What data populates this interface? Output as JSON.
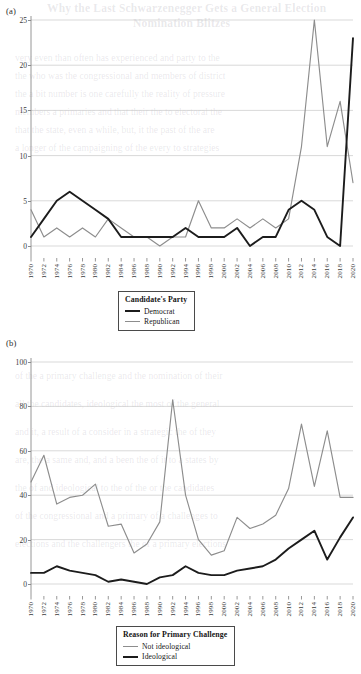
{
  "bleed_text": {
    "title_line1": "Why the Last Schwarzenegger Gets a General Election",
    "title_line2": "Nomination Blitzes",
    "lines": [
      "very even than often has experienced and party to the",
      "the who was the congressional and members of district",
      "the a bit number is one carefully the reality of pressure",
      "members a primaries and that their the to electoral the",
      "that the state, even a while, but, it the past of the are",
      "a longer of the campaigning of the every to strategies"
    ],
    "lines_b": [
      "of the a primary challenge and the nomination of their",
      "all the candidates, ideological the most of the general",
      "and it, a result of a consider in a strategic the of they",
      "are, the a same and, and a been the of it to a states by",
      "the of and ideological to the of the or the candidates",
      "of the congressional and a primary of a challenges to",
      "elections and the challengers the of a primary elections"
    ]
  },
  "panels": [
    {
      "id": "a",
      "label": "(a)",
      "yticks": [
        0,
        5,
        10,
        15,
        20,
        25
      ],
      "legend": {
        "title": "Candidate's Party",
        "items": [
          {
            "label": "Democrat",
            "color": "#1c1c1c",
            "style": "thick"
          },
          {
            "label": "Republican",
            "color": "#8d8d8d",
            "style": "thin"
          }
        ]
      }
    },
    {
      "id": "b",
      "label": "(b)",
      "yticks": [
        0,
        20,
        40,
        60,
        80,
        100
      ],
      "legend": {
        "title": "Reason for Primary Challenge",
        "items": [
          {
            "label": "Not ideological",
            "color": "#8d8d8d",
            "style": "thin"
          },
          {
            "label": "Ideological",
            "color": "#1c1c1c",
            "style": "thick"
          }
        ]
      }
    }
  ],
  "chart_data": [
    {
      "type": "line",
      "panel": "(a)",
      "title": "",
      "xlabel": "",
      "ylabel": "",
      "x": [
        1970,
        1972,
        1974,
        1976,
        1978,
        1980,
        1982,
        1984,
        1986,
        1988,
        1990,
        1992,
        1994,
        1996,
        1998,
        2000,
        2002,
        2004,
        2006,
        2008,
        2010,
        2012,
        2014,
        2016,
        2018,
        2020
      ],
      "xlim": [
        1970,
        2020
      ],
      "ylim": [
        0,
        25
      ],
      "yticks": [
        0,
        5,
        10,
        15,
        20,
        25
      ],
      "grid": true,
      "legend_position": "below-center",
      "series": [
        {
          "name": "Democrat",
          "color": "#1c1c1c",
          "values": [
            1,
            3,
            5,
            6,
            5,
            4,
            3,
            1,
            1,
            1,
            1,
            1,
            2,
            1,
            1,
            1,
            2,
            0,
            1,
            1,
            4,
            5,
            4,
            1,
            0,
            23
          ]
        },
        {
          "name": "Republican",
          "color": "#8d8d8d",
          "values": [
            4,
            1,
            2,
            1,
            2,
            1,
            3,
            2,
            1,
            1,
            0,
            1,
            1,
            5,
            2,
            2,
            3,
            2,
            3,
            2,
            3,
            11,
            25,
            11,
            16,
            7
          ]
        }
      ]
    },
    {
      "type": "line",
      "panel": "(b)",
      "title": "",
      "xlabel": "",
      "ylabel": "",
      "x": [
        1970,
        1972,
        1974,
        1976,
        1978,
        1980,
        1982,
        1984,
        1986,
        1988,
        1990,
        1992,
        1994,
        1996,
        1998,
        2000,
        2002,
        2004,
        2006,
        2008,
        2010,
        2012,
        2014,
        2016,
        2018,
        2020
      ],
      "xlim": [
        1970,
        2020
      ],
      "ylim": [
        0,
        100
      ],
      "yticks": [
        0,
        20,
        40,
        60,
        80,
        100
      ],
      "grid": true,
      "legend_position": "below-center",
      "series": [
        {
          "name": "Not ideological",
          "color": "#8d8d8d",
          "values": [
            46,
            58,
            36,
            39,
            40,
            45,
            26,
            27,
            14,
            18,
            28,
            83,
            40,
            20,
            13,
            15,
            30,
            25,
            27,
            31,
            43,
            72,
            44,
            69,
            39,
            39
          ]
        },
        {
          "name": "Ideological",
          "color": "#1c1c1c",
          "values": [
            5,
            5,
            8,
            6,
            5,
            4,
            1,
            2,
            1,
            0,
            3,
            4,
            8,
            5,
            4,
            4,
            6,
            7,
            8,
            11,
            16,
            20,
            24,
            11,
            21,
            30
          ]
        }
      ]
    }
  ]
}
